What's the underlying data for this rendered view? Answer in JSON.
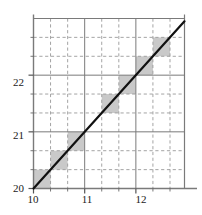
{
  "chart_data": {
    "type": "line",
    "title": "",
    "subtitle": "",
    "xlabel": "",
    "ylabel": "",
    "xlim": [
      10,
      12.95
    ],
    "ylim": [
      20,
      23.0
    ],
    "grid": true,
    "grid_major_style": "solid",
    "grid_minor_style": "dashed",
    "legend": "none",
    "x_major_ticks": [
      10,
      11,
      12
    ],
    "x_major_tick_labels": [
      "10",
      "11",
      "12"
    ],
    "y_major_ticks": [
      20,
      21,
      22
    ],
    "y_major_tick_labels": [
      "20",
      "21",
      "22"
    ],
    "x_minor_ticks": [
      10.333,
      10.667,
      11.333,
      11.667,
      12.333,
      12.667
    ],
    "y_minor_ticks": [
      20.333,
      20.667,
      21.333,
      21.667,
      22.333,
      22.667
    ],
    "series": [
      {
        "name": "identity-line",
        "type": "line",
        "color": "#111111",
        "width": 2.2,
        "x": [
          10,
          12.95
        ],
        "y": [
          20,
          22.95
        ]
      },
      {
        "name": "staircase-blocks",
        "type": "area",
        "color": "#c9c9c9",
        "description": "gray step cells straddling the line on the 1/3 grid",
        "cells": [
          {
            "x0": 10.0,
            "x1": 10.333,
            "y0": 20.0,
            "y1": 20.333
          },
          {
            "x0": 10.333,
            "x1": 10.667,
            "y0": 20.333,
            "y1": 20.667
          },
          {
            "x0": 10.667,
            "x1": 11.0,
            "y0": 20.667,
            "y1": 21.0
          },
          {
            "x0": 11.333,
            "x1": 11.667,
            "y0": 21.333,
            "y1": 21.667
          },
          {
            "x0": 11.667,
            "x1": 12.0,
            "y0": 21.667,
            "y1": 22.0
          },
          {
            "x0": 12.0,
            "x1": 12.333,
            "y0": 22.0,
            "y1": 22.333
          },
          {
            "x0": 12.333,
            "x1": 12.667,
            "y0": 22.333,
            "y1": 22.667
          }
        ]
      }
    ]
  },
  "axes": {
    "axis_color": "#7a7a7a",
    "major_grid_color": "#7a7a7a",
    "minor_grid_color": "#9a9a9a",
    "tick_color": "#555555",
    "shade_color": "#c9c9c9",
    "line_color": "#111111",
    "background": "#ffffff"
  },
  "labels": {
    "y": [
      {
        "text": "22",
        "value": 22
      },
      {
        "text": "21",
        "value": 21
      },
      {
        "text": "20",
        "value": 20
      }
    ],
    "x": [
      {
        "text": "10",
        "value": 10
      },
      {
        "text": "11",
        "value": 11
      },
      {
        "text": "12",
        "value": 12
      }
    ]
  }
}
